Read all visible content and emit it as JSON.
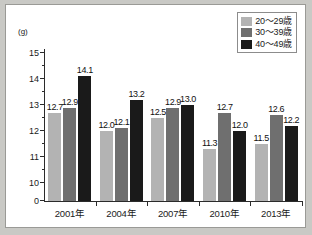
{
  "chart_data": {
    "type": "bar",
    "title": "",
    "subtitle": "",
    "xlabel": "",
    "ylabel": "(g)",
    "unit_label": "(g)",
    "categories": [
      "2001年",
      "2004年",
      "2007年",
      "2010年",
      "2013年"
    ],
    "series": [
      {
        "name": "20～29歳",
        "color": "#b3b3b3",
        "values": [
          12.7,
          12.0,
          12.5,
          11.3,
          11.5
        ]
      },
      {
        "name": "30～39歳",
        "color": "#6f6f6f",
        "values": [
          12.9,
          12.1,
          12.9,
          12.7,
          12.6
        ]
      },
      {
        "name": "40～49歳",
        "color": "#1a1a1a",
        "values": [
          14.1,
          13.2,
          13.0,
          12.0,
          12.2
        ]
      }
    ],
    "value_labels": [
      [
        "12.7",
        "12.9",
        "14.1"
      ],
      [
        "12.0",
        "12.1",
        "13.2"
      ],
      [
        "12.5",
        "12.9",
        "13.0"
      ],
      [
        "11.3",
        "12.7",
        "12.0"
      ],
      [
        "11.5",
        "12.6",
        "12.2"
      ]
    ],
    "ylim": [
      0,
      15
    ],
    "y_axis_break": true,
    "y_break_from": 0,
    "y_break_to": 10,
    "ytick_labels": [
      "15",
      "14",
      "13",
      "12",
      "11",
      "10",
      "0"
    ],
    "ytick_values": [
      15,
      14,
      13,
      12,
      11,
      10,
      0
    ],
    "yminor_values": [
      14.5,
      13.5,
      12.5,
      11.5,
      10.5,
      10.0
    ],
    "grid": false,
    "legend_position": "top-right"
  },
  "legend": {
    "items": [
      {
        "label": "20～29歳",
        "color": "#b3b3b3"
      },
      {
        "label": "30～39歳",
        "color": "#6f6f6f"
      },
      {
        "label": "40～49歳",
        "color": "#1a1a1a"
      }
    ]
  }
}
